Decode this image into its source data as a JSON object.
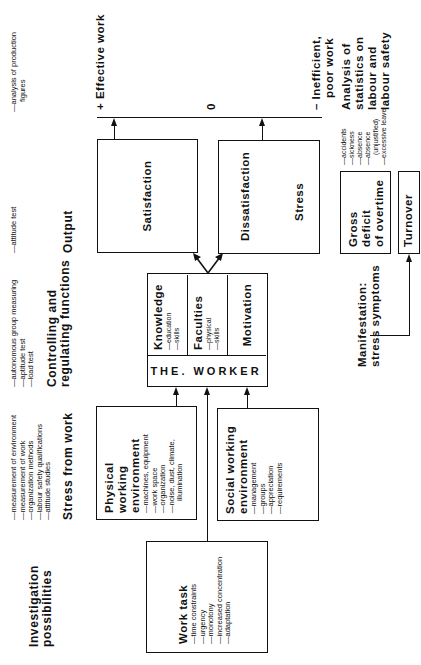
{
  "columns": {
    "investigation": "Investigation possibilities",
    "stress": "Stress from work",
    "controlling": "Controlling and regulating functions",
    "output": "Output",
    "manifestation": "Manifestation: stress symptoms"
  },
  "investigation_methods": {
    "stress": [
      "—measurement of environment",
      "—measurement of work",
      "—organization methods",
      "—labour safety qualifications",
      "—attitude studies"
    ],
    "controlling": [
      "—autonomous group measuring",
      "—aptitude test",
      "—load test"
    ],
    "output": [
      "—attitude test"
    ],
    "effective": [
      "—analysis of production",
      "figures"
    ]
  },
  "work_task": {
    "title": "Work task",
    "items": [
      "—time constraints",
      "—urgency",
      "—monotony",
      "—increased concentration",
      "—adaptation"
    ]
  },
  "physical_env": {
    "title_line1": "Physical working",
    "title_line2": "environment",
    "items": [
      "—machines, equipment",
      "—work space",
      "—organization",
      "—noise, dust, climate,",
      "illumination"
    ]
  },
  "social_env": {
    "title_line1": "Social working",
    "title_line2": "environment",
    "items": [
      "—management",
      "—groups",
      "—appreciation",
      "—requirements"
    ]
  },
  "worker": {
    "label": "THE. WORKER",
    "knowledge": {
      "title": "Knowledge",
      "items": [
        "—education",
        "—skills"
      ]
    },
    "faculties": {
      "title": "Faculties",
      "items": [
        "—physical",
        "—skills"
      ]
    },
    "motivation": {
      "title": "Motivation"
    }
  },
  "outputs": {
    "satisfaction": "Satisfaction",
    "dissatisfaction": "Dissatisfaction",
    "stress": "Stress"
  },
  "scale": {
    "positive": "+ Effective work",
    "zero": "0",
    "negative_line1": "– Inefficient,",
    "negative_line2": "poor work"
  },
  "statistics": {
    "title_lines": [
      "Analysis of",
      "statistics on",
      "labour and",
      "labour safety"
    ],
    "items": [
      "—accidents",
      "—sickness",
      "—absence",
      "—absence",
      "(unjustified)",
      "—excessive leave"
    ]
  },
  "symptoms": {
    "gross_deficit_line1": "Gross deficit",
    "gross_deficit_line2": "of overtime",
    "turnover": "Turnover"
  }
}
